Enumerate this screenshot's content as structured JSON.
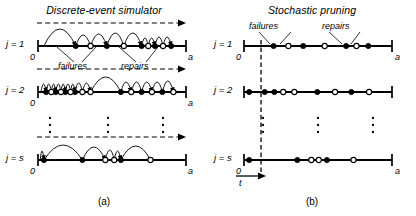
{
  "figure": {
    "panels": [
      {
        "id": "a",
        "title": "Discrete-event simulator",
        "caption": "(a)",
        "origin_label": "0",
        "end_label": "a",
        "annotations": {
          "failures": "failures",
          "repairs": "repairs"
        },
        "rows": [
          {
            "label": "j = 1",
            "failures": [
              0.255,
              0.465,
              0.7,
              0.79,
              0.9
            ],
            "repairs": [
              0.355,
              0.58,
              0.745,
              0.845
            ],
            "arcs": [
              {
                "from": 0.04,
                "to": 0.255,
                "h": 17,
                "arrow": true
              },
              {
                "from": 0.255,
                "to": 0.355,
                "h": 11,
                "arrow": false
              },
              {
                "from": 0.355,
                "to": 0.465,
                "h": 12,
                "arrow": true
              },
              {
                "from": 0.465,
                "to": 0.58,
                "h": 13,
                "arrow": false
              },
              {
                "from": 0.58,
                "to": 0.7,
                "h": 13,
                "arrow": true
              },
              {
                "from": 0.7,
                "to": 0.745,
                "h": 8,
                "arrow": false
              },
              {
                "from": 0.745,
                "to": 0.79,
                "h": 8,
                "arrow": true
              },
              {
                "from": 0.79,
                "to": 0.845,
                "h": 9,
                "arrow": false
              },
              {
                "from": 0.845,
                "to": 0.9,
                "h": 9,
                "arrow": true
              }
            ]
          },
          {
            "label": "j = 2",
            "failures": [
              0.055,
              0.12,
              0.185,
              0.25,
              0.56,
              0.7,
              0.84
            ],
            "repairs": [
              0.09,
              0.155,
              0.22,
              0.3,
              0.355,
              0.63,
              0.77,
              0.915
            ],
            "arcs": [
              {
                "from": 0.02,
                "to": 0.055,
                "h": 8,
                "arrow": true
              },
              {
                "from": 0.055,
                "to": 0.09,
                "h": 8,
                "arrow": false
              },
              {
                "from": 0.09,
                "to": 0.12,
                "h": 8,
                "arrow": true
              },
              {
                "from": 0.12,
                "to": 0.155,
                "h": 8,
                "arrow": false
              },
              {
                "from": 0.155,
                "to": 0.185,
                "h": 8,
                "arrow": true
              },
              {
                "from": 0.185,
                "to": 0.22,
                "h": 8,
                "arrow": false
              },
              {
                "from": 0.22,
                "to": 0.25,
                "h": 8,
                "arrow": true
              },
              {
                "from": 0.25,
                "to": 0.3,
                "h": 9,
                "arrow": false
              },
              {
                "from": 0.3,
                "to": 0.355,
                "h": 9,
                "arrow": true
              },
              {
                "from": 0.355,
                "to": 0.56,
                "h": 15,
                "arrow": false
              },
              {
                "from": 0.56,
                "to": 0.63,
                "h": 10,
                "arrow": true
              },
              {
                "from": 0.63,
                "to": 0.7,
                "h": 10,
                "arrow": false
              },
              {
                "from": 0.7,
                "to": 0.77,
                "h": 10,
                "arrow": true
              },
              {
                "from": 0.77,
                "to": 0.84,
                "h": 10,
                "arrow": false
              },
              {
                "from": 0.84,
                "to": 0.915,
                "h": 11,
                "arrow": true
              }
            ]
          },
          {
            "label": "j = s",
            "failures": [
              0.04,
              0.3,
              0.56
            ],
            "repairs": [
              0.455,
              0.515,
              0.76
            ],
            "arcs": [
              {
                "from": 0.015,
                "to": 0.04,
                "h": 9,
                "arrow": true
              },
              {
                "from": 0.04,
                "to": 0.3,
                "h": 15,
                "arrow": false
              },
              {
                "from": 0.3,
                "to": 0.455,
                "h": 13,
                "arrow": true
              },
              {
                "from": 0.455,
                "to": 0.515,
                "h": 10,
                "arrow": false
              },
              {
                "from": 0.515,
                "to": 0.56,
                "h": 9,
                "arrow": true
              },
              {
                "from": 0.56,
                "to": 0.76,
                "h": 14,
                "arrow": false
              }
            ]
          }
        ]
      },
      {
        "id": "b",
        "title": "Stochastic pruning",
        "caption": "(b)",
        "origin_label": "0",
        "end_label": "a",
        "time_label": "t",
        "time_position": 0.115,
        "annotations": {
          "failures": "failures",
          "repairs": "repairs"
        },
        "rows": [
          {
            "label": "j = 1",
            "failures": [
              0.2,
              0.4,
              0.69,
              0.84
            ],
            "repairs": [
              0.3,
              0.545,
              0.76
            ]
          },
          {
            "label": "j = 2",
            "failures": [
              0.035,
              0.14,
              0.205,
              0.495,
              0.725
            ],
            "repairs": [
              0.265,
              0.34,
              0.615,
              0.845
            ]
          },
          {
            "label": "j = s",
            "failures": [
              0.035,
              0.36,
              0.56
            ],
            "repairs": [
              0.455,
              0.505,
              0.74
            ]
          }
        ]
      }
    ]
  }
}
